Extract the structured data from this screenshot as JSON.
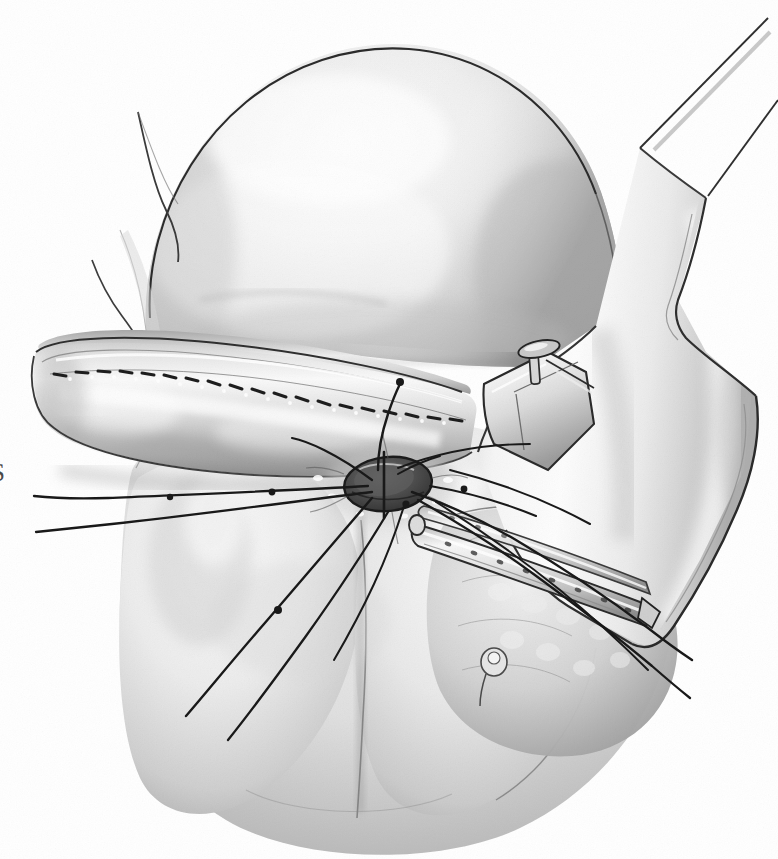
{
  "image": {
    "kind": "medical-surgical-illustration",
    "technique": "grayscale pen-and-ink with airbrush tonal shading",
    "title": "Transanal stapled coloanal anastomosis",
    "width": 778,
    "height": 859,
    "background_color": "#ffffff",
    "ink_color": "#1a1a1a",
    "tone_light": "#f2f2f2",
    "tone_mid": "#c8c8c8",
    "tone_dark": "#8a8a8a",
    "tone_deep": "#4a4a4a"
  },
  "edge_label": {
    "text": "S",
    "note": "partial character cropped at the left margin"
  },
  "anatomy": [
    {
      "name": "buttock-dome",
      "label": "Right buttock / gluteal dome",
      "description": "Large smooth shaded dome occupying the upper half of the frame"
    },
    {
      "name": "left-gluteal-fold",
      "label": "Left gluteal fold with spur notch",
      "description": "Narrow tissue fold with a pointed spur at the upper left of the dome"
    },
    {
      "name": "everted-bowel-segment",
      "label": "Everted bowel segment with staple line",
      "description": "Tubular structure crossing the mid-left with a dashed staple/suture line along its crest"
    },
    {
      "name": "anal-verge",
      "label": "Anal verge / anastomotic opening",
      "description": "Dark oval aperture at centre with radiating stay sutures"
    },
    {
      "name": "perineal-body",
      "label": "Perineal body and lower buttocks",
      "description": "Two rounded masses below the opening separated by the natal cleft"
    },
    {
      "name": "ischiorectal-tissue",
      "label": "Ischiorectal fat and lobulated tissue",
      "description": "Lobular shaded tissue at the lower right beneath the retractor"
    }
  ],
  "instruments": [
    {
      "name": "circular-stapler",
      "label": "Circular stapler body",
      "description": "Angled instrument entering from the right, body shaded as polished metal"
    },
    {
      "name": "stapler-anvil-head",
      "label": "Stapler anvil head with trocar pin",
      "description": "Rectangular head with a T-shaped trocar pin projecting upward"
    },
    {
      "name": "stapler-shaft",
      "label": "Stapler shaft",
      "description": "Two long tapering lines running to the upper right corner"
    },
    {
      "name": "retractor-blade",
      "label": "Perforated retractor blade",
      "description": "Flat blade with a row of small perforations lying across the lower right tissue"
    }
  ],
  "sutures": {
    "label": "Stay sutures",
    "count": 12,
    "description": "Fine dark monofilament strands converging on the anastomotic opening; several exit the left margin and the lower frame"
  }
}
